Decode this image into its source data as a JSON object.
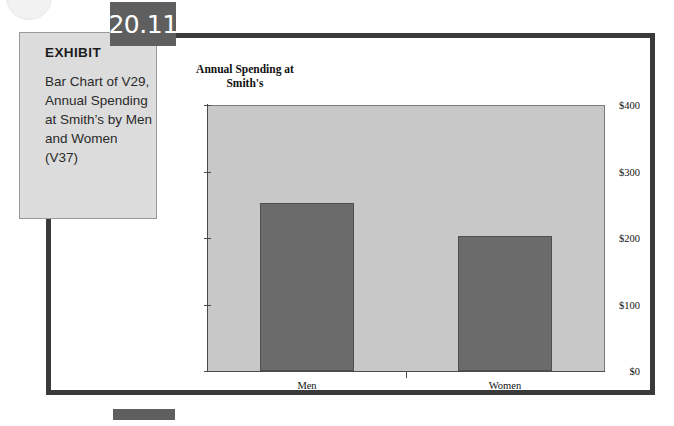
{
  "exhibit": {
    "label": "EXHIBIT",
    "number": "20.11",
    "description": "Bar Chart of V29, Annual Spending at Smith’s by Men and Women (V37)"
  },
  "colors": {
    "frame": "#3a3a3a",
    "exhibit_box": "#dcdcdc",
    "number_tab": "#5f5f5f",
    "plot_background": "#c8c8c8",
    "bar_fill": "#6b6b6b",
    "axis": "#4a4a4a"
  },
  "chart_data": {
    "type": "bar",
    "title": "Annual Spending at Smith's",
    "title_lines": [
      "Annual Spending at",
      "Smith's"
    ],
    "xlabel": "",
    "ylabel": "",
    "categories": [
      "Men",
      "Women"
    ],
    "values": [
      253,
      203
    ],
    "ylim": [
      0,
      400
    ],
    "yticks": [
      0,
      100,
      200,
      300,
      400
    ],
    "ytick_labels": [
      "$0",
      "$100",
      "$200",
      "$300",
      "$400"
    ],
    "grid": false,
    "legend": null,
    "series": [
      {
        "name": "Annual Spending at Smith's",
        "values": [
          253,
          203
        ]
      }
    ]
  }
}
